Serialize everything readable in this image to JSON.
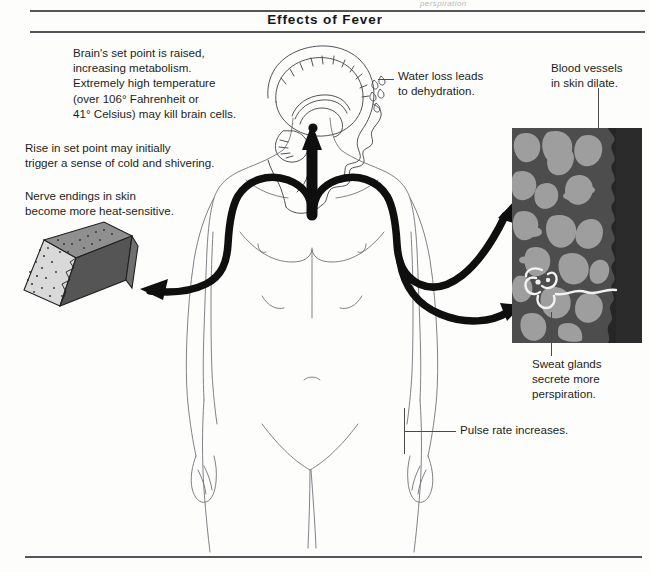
{
  "document": {
    "title": "Effects of Fever",
    "top_fragment": "perspiration"
  },
  "captions": {
    "brain_set_point": "Brain's set point is raised,\nincreasing metabolism.\nExtremely high temperature\n(over 106° Fahrenheit or\n41° Celsius) may kill brain cells.",
    "rise_in_set_point": "Rise in set point may initially\ntrigger a sense of cold and shivering.",
    "nerve_endings": "Nerve endings in skin\nbecome more heat-sensitive.",
    "water_loss": "Water loss leads\nto dehydration.",
    "blood_vessels": "Blood vessels\nin skin dilate.",
    "sweat_glands": "Sweat glands\nsecrete more\nperspiration.",
    "pulse_rate": "Pulse rate increases."
  },
  "illustrations": {
    "head": "sagittal-head-brain-cross-section",
    "body": "anterior-human-body-outline",
    "skin_block": "3d-skin-wedge-block-with-nerve-endings",
    "skin_panel": "skin-cross-section-dilated-blood-vessels-and-sweat-gland",
    "sweat_droplets": "perspiration-droplets-on-head"
  },
  "colors": {
    "ink": "#1d1d20",
    "rule": "#55565a",
    "body_outline": "#6e6e72",
    "nerve_path": "#111111",
    "skin_dark": "#4d4d4d",
    "skin_vessel": "#9c9c9c",
    "skin_epidermis": "#2b2b2b",
    "skin_block_face": "#585858",
    "skin_block_top": "#8e8e8e",
    "sweat_gland": "#f2f2f2"
  }
}
